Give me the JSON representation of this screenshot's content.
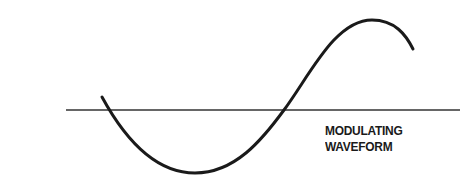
{
  "diagram": {
    "label": {
      "line1": "MODULATING",
      "line2": "WAVEFORM"
    },
    "axis": {
      "y": 110,
      "x_start": 66,
      "x_end": 460,
      "color": "#333333"
    },
    "waveform": {
      "type": "sine",
      "color": "#1a1a1a",
      "start": [
        102,
        97
      ],
      "zero_crossing_1": [
        109,
        110
      ],
      "trough": [
        195,
        173
      ],
      "zero_crossing_2": [
        284,
        110
      ],
      "peak": [
        372,
        20
      ],
      "end": [
        413,
        49
      ]
    }
  }
}
